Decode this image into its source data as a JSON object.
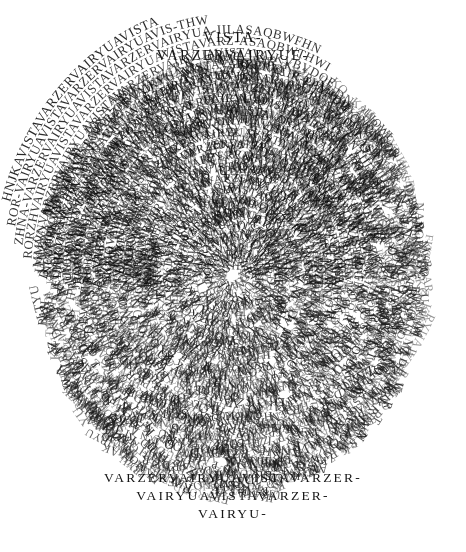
{
  "artwork": {
    "title": "Asemic Text Disc",
    "background_color": "#ffffff",
    "ink_color": "#1c1c1c",
    "canvas": {
      "width": 466,
      "height": 552
    },
    "disc": {
      "center_x": 233,
      "center_y": 275,
      "radius_x": 215,
      "radius_y": 245
    },
    "top_lines": [
      {
        "text": "VISTA-",
        "y": 42,
        "size": 14.5,
        "spacing": 2.6
      },
      {
        "text": "VARZERVAIRYUE-",
        "y": 60,
        "size": 14.5,
        "spacing": 1.4
      }
    ],
    "bottom_lines": [
      {
        "text": "VARZERVAIRYUAVISTAVARZER-",
        "y": 482,
        "size": 13.5,
        "spacing": 0.6
      },
      {
        "text": "VAIRYUAVISTAVARZER-",
        "y": 500,
        "size": 13.5,
        "spacing": 0.8
      },
      {
        "text": "VAIRYU-",
        "y": 518,
        "size": 13.5,
        "spacing": 2.6
      }
    ],
    "arcs": [
      {
        "text": "HNJKAVISTAVARZERVAIRYUAVISTA",
        "radius": 232,
        "size": 13.5,
        "opacity": 0.95,
        "start_deg": 196,
        "sweep_deg": 148
      },
      {
        "text": "ROR-VAIRYUAVISTAVARZERVAIRYUAVIS-THW",
        "radius": 222,
        "size": 13,
        "opacity": 0.92,
        "start_deg": 191,
        "sweep_deg": 158
      },
      {
        "text": "ZHNA-VARZERVAIRYUAVISTAVARZERVAIRYUA-IILASAQBWFHN",
        "radius": 212,
        "size": 13,
        "opacity": 0.9,
        "start_deg": 187,
        "sweep_deg": 166
      },
      {
        "text": "RORZHVAIRYUAVISTAVARZERVAIRYUAVISTAVARZ-ASAQBWTHWI",
        "radius": 202,
        "size": 12.8,
        "opacity": 0.88,
        "start_deg": 184,
        "sweep_deg": 172
      },
      {
        "text": "MMVNVARZERVAIRYUAVISTAVARZERVAIRYUAVISTAVA-KVBVDQE",
        "radius": 192,
        "size": 12.6,
        "opacity": 0.86,
        "start_deg": 182,
        "sweep_deg": 176
      },
      {
        "text": "NEUOPKVAIRYUAVISTAVARZERVAIRYUAVISTAVARZERVAIR-PPAHDG",
        "radius": 182,
        "size": 12.5,
        "opacity": 0.85,
        "start_deg": 180,
        "sweep_deg": 180
      },
      {
        "text": "LIHIJOVARZERVAIRYUAVISTAVARZERVAIRYUAVISTAVARZERVA-WFIILASA",
        "radius": 172,
        "size": 12.4,
        "opacity": 0.85,
        "start_deg": 179,
        "sweep_deg": 182
      },
      {
        "text": "UIOWVAIRYUAVISTAVARZERVAIRYUAVISTAVARZERVAIRYUAVIST-NTIILASA",
        "radius": 162,
        "size": 12.3,
        "opacity": 0.85,
        "start_deg": 178,
        "sweep_deg": 184
      },
      {
        "text": "RORDKVARZERVAIRYUAVISTAVARZERVAIRYUAVISTAVARZERVAIRY-KTHW",
        "radius": 152,
        "size": 12.2,
        "opacity": 0.85,
        "start_deg": 177,
        "sweep_deg": 186
      },
      {
        "text": "RORZARVAIRYUAVISTAVARZERVAIRYUAVISTAVARZERVAIRYUAVIS-AKLIK",
        "radius": 142,
        "size": 12.1,
        "opacity": 0.85,
        "start_deg": 177,
        "sweep_deg": 186
      },
      {
        "text": "NAVARZERVAIRYUAVISTAVARZERVAIRYUAVISTAVARZERVAIRYUAVI-AIL",
        "radius": 132,
        "size": 12,
        "opacity": 0.85,
        "start_deg": 176,
        "sweep_deg": 188
      },
      {
        "text": "DKMOVAIRYUAVISTAVARZERVAIRYUAVISTAVARZERVAIRYUAVISTAV-FKD",
        "radius": 122,
        "size": 12,
        "opacity": 0.85,
        "start_deg": 176,
        "sweep_deg": 188
      },
      {
        "text": "NVARZERVAIRYUAVISTAVARZERVAIRYUAVISTAVARZERVAIRYUAVIST-ORE",
        "radius": 112,
        "size": 11.9,
        "opacity": 0.85,
        "start_deg": 175,
        "sweep_deg": 190
      },
      {
        "text": "NDKOFVAIRYUAVISTAVARZERVAIRYUAVISTAVARZERVAIRYUAVISTA-PH",
        "radius": 102,
        "size": 11.9,
        "opacity": 0.85,
        "start_deg": 175,
        "sweep_deg": 190
      },
      {
        "text": "NKKOVARZERVAIRYUAVISTAVARZERVAIRYUAVISTAVARZERVAIRYUA-AW",
        "radius": 92,
        "size": 11.8,
        "opacity": 0.85,
        "start_deg": 174,
        "sweep_deg": 192
      },
      {
        "text": "KJDKVAIRYUAVISTAVARZERVAIRYUAVISTAVARZERVAIRYUAVISTAV-STA-",
        "radius": 82,
        "size": 11.8,
        "opacity": 0.85,
        "start_deg": 174,
        "sweep_deg": 192
      },
      {
        "text": "FKOVARZERVAIRYUAVISTAVARZERVAIRYUAVISTAVARZERVAIRYUAVI-YR-",
        "radius": 72,
        "size": 11.7,
        "opacity": 0.85,
        "start_deg": 173,
        "sweep_deg": 194
      },
      {
        "text": "ZKDVAIRYUAVISTAVARZERVAIRYUAVISTAVARZERVAIRYUAVISTAVAR-WR-",
        "radius": 62,
        "size": 11.7,
        "opacity": 0.85,
        "start_deg": 173,
        "sweep_deg": 194
      },
      {
        "text": "ZKRVARZERVAIRYUAVISTAVARZERVAIRYUAVISTAVARZERVAIRYUAV-KKL-",
        "radius": 52,
        "size": 11.6,
        "opacity": 0.85,
        "start_deg": 172,
        "sweep_deg": 196
      },
      {
        "text": "HTUVAIRYUAVISTAVARZERVAIRYUAVISTAVARZERVAIRYUAVIS-VARZER-",
        "radius": 42,
        "size": 11.6,
        "opacity": 0.85,
        "start_deg": 172,
        "sweep_deg": 196
      },
      {
        "text": "VAIRYUAVISTAVARZERVAIRYUAVISTAVARZERVAIRYU-TYUI-",
        "radius": 32,
        "size": 11.5,
        "opacity": 0.85,
        "start_deg": 175,
        "sweep_deg": 190
      },
      {
        "text": "OPAVISTAVARZERVAIRYUAVISTAVARZERVAIRYU-AVISTA-",
        "radius": 22,
        "size": 11.5,
        "opacity": 0.85,
        "start_deg": 178,
        "sweep_deg": 184
      },
      {
        "text": "VARZERVAIRYUAVISTAVARZERVAIRYU-HAVISTA-",
        "radius": 12,
        "size": 11.5,
        "opacity": 0.85,
        "start_deg": 184,
        "sweep_deg": 172
      }
    ],
    "fill_alphabet": "VAIRYUAVISTAVARZERVAIRYUAVISTAVARZERZHNAKVBVDQEPPAHDGIILASAQBWFHNTHWKLIKAILFKDOREPHAWSTAYRWRKKLTYUIHTUZKRZKDFKOKJDKNKKONDKOFDKMONARORZARRORDKUIOWLIHIJONEUOPKMMVNRORZH",
    "legible_fragments_left": [
      "ROR-",
      "ZHNA-",
      "RORZH",
      "MMVN",
      "NEUOPK",
      "LIHIJO",
      "UIOW",
      "RORDK",
      "RORZAR",
      "NA",
      "DKMO",
      "N",
      "NDKOF",
      "NKKO",
      "KJDK",
      "FKO",
      "ZKD",
      "ZKR",
      "HTU",
      "VAIR",
      "OPA"
    ],
    "legible_fragments_right": [
      "THW",
      "IILASAQBWFHN",
      "ASAQBWTHWI",
      "KVBVDQE",
      "PPAHDG",
      "WFIILASA",
      "NTIILASA",
      "KTHW",
      "AKLIK",
      "AIL",
      "FKD",
      "ORE",
      "PH",
      "AW",
      "STA-",
      "YR-",
      "WR-",
      "KKL-",
      "VARZER-",
      "TYUI-",
      "AVISTA-",
      "HAVISTA-"
    ]
  }
}
